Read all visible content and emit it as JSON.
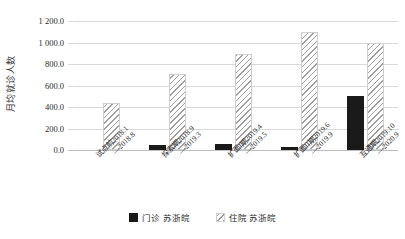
{
  "chart_data": {
    "type": "bar",
    "title": "",
    "xlabel": "",
    "ylabel": "月均就诊人数",
    "ylim": [
      0,
      1200
    ],
    "ytick_values": [
      0,
      200,
      400,
      600,
      800,
      1000,
      1200
    ],
    "ytick_labels": [
      "0.0",
      "200.0",
      "400.0",
      "600.0",
      "800.0",
      "1 000.0",
      "1 200.0"
    ],
    "grid": true,
    "legend_position": "bottom",
    "categories": [
      "试点前2018.1—2018.8",
      "探索期2018.9—2019.3",
      "扩面I期2019.4—2019.5",
      "扩面II期2019.6—2019.9",
      "互通期2019.10—2020.9"
    ],
    "category_lines": [
      {
        "line1": "试点前2018.1",
        "line2": "—2018.8"
      },
      {
        "line1": "探索期2018.9",
        "line2": "—2019.3"
      },
      {
        "line1": "扩面I期2019.4",
        "line2": "—2019.5"
      },
      {
        "line1": "扩面II期2019.6",
        "line2": "—2019.9"
      },
      {
        "line1": "互通期2019.10",
        "line2": "—2020.9"
      }
    ],
    "series": [
      {
        "name": "门诊 苏浙皖",
        "key": "outpatient",
        "color": "#1a1a1a",
        "pattern": "solid",
        "values": [
          0,
          50,
          55,
          30,
          500
        ]
      },
      {
        "name": "住院 苏浙皖",
        "key": "inpatient",
        "color": "#9e9e9e",
        "pattern": "diagonal-hatch",
        "values": [
          440,
          710,
          890,
          1100,
          1000
        ]
      }
    ]
  },
  "legend": {
    "items": [
      {
        "label": "门诊 苏浙皖",
        "swatch": "outpatient"
      },
      {
        "label": "住院 苏浙皖",
        "swatch": "inpatient"
      }
    ]
  }
}
